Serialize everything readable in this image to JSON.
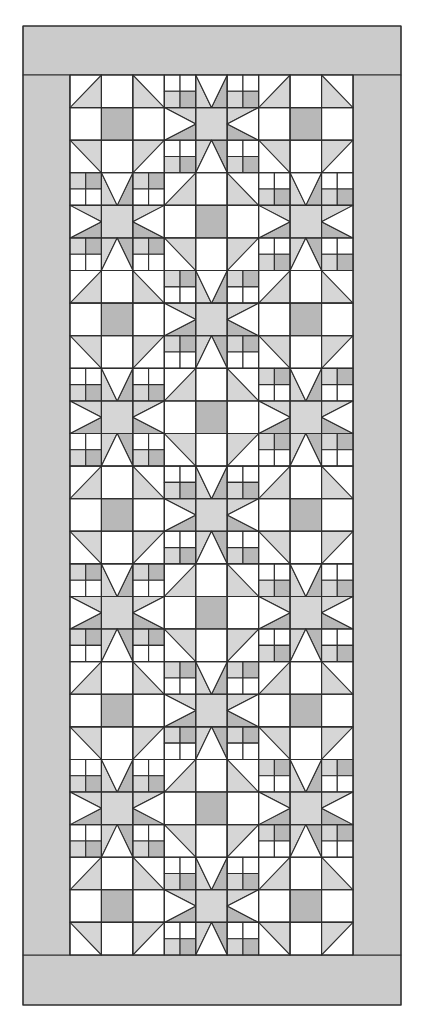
{
  "figure": {
    "canvas": {
      "width": 422,
      "height": 1016,
      "background": "#ffffff"
    }
  },
  "colors": {
    "white": "#ffffff",
    "light": "#d6d6d6",
    "medium": "#b8b8b8",
    "dark": "#a8a8a8",
    "border": "#cbcbcb",
    "line": "#2e2e2e"
  },
  "border": {
    "outer": {
      "x": 23,
      "y": 26,
      "w": 378,
      "h": 979
    },
    "top": {
      "x": 23,
      "y": 26,
      "w": 378,
      "h": 49
    },
    "bottom": {
      "x": 23,
      "y": 955,
      "w": 378,
      "h": 50
    },
    "left": {
      "x": 23,
      "y": 75,
      "w": 47,
      "h": 880
    },
    "right": {
      "x": 353,
      "y": 75,
      "w": 48,
      "h": 880
    }
  },
  "field": {
    "x": 70,
    "y": 75,
    "w": 283,
    "h": 880,
    "unit_cols": 9,
    "unit_rows": 27,
    "block_cols": 3,
    "block_rows": 9,
    "layout": [
      [
        "shoofly",
        "star",
        "shoofly"
      ],
      [
        "star",
        "shoofly",
        "star"
      ],
      [
        "shoofly",
        "star",
        "shoofly"
      ],
      [
        "star",
        "shoofly",
        "star"
      ],
      [
        "shoofly",
        "star",
        "shoofly"
      ],
      [
        "star",
        "shoofly",
        "star"
      ],
      [
        "shoofly",
        "star",
        "shoofly"
      ],
      [
        "star",
        "shoofly",
        "star"
      ],
      [
        "shoofly",
        "star",
        "shoofly"
      ]
    ]
  },
  "blocks": {
    "shoofly": {
      "units": [
        [
          "hst-br",
          "white",
          "hst-bl"
        ],
        [
          "white",
          "center",
          "white"
        ],
        [
          "hst-tr",
          "white",
          "hst-tl"
        ]
      ]
    },
    "star": {
      "units": [
        [
          "fourpatch",
          "point-down",
          "fourpatch"
        ],
        [
          "point-right",
          "center",
          "point-left"
        ],
        [
          "fourpatch",
          "point-up",
          "fourpatch"
        ]
      ]
    }
  },
  "shade_cycle": [
    "light",
    "medium",
    "light",
    "dark"
  ]
}
